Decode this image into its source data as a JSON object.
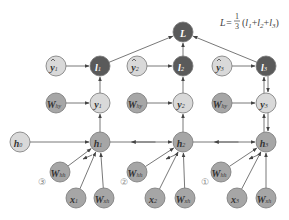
{
  "diagram": {
    "formula": {
      "lhs": "L=",
      "frac_num": "1",
      "frac_den": "3",
      "rhs_open": "(",
      "terms": [
        "l",
        "1",
        "+",
        "l",
        "2",
        "+",
        "l",
        "3"
      ],
      "rhs_close": ")"
    },
    "colors": {
      "dark_fill": "#5a5a5a",
      "dark_text": "#ffffff",
      "light_fill": "#d9d9d9",
      "mid_fill": "#a6a6a6",
      "stroke": "#777777",
      "edge": "#555555",
      "text": "#333333"
    },
    "nodes": [
      {
        "id": "L",
        "base": "L",
        "sub": "",
        "hat": false,
        "style": "dark"
      },
      {
        "id": "yhat1",
        "base": "y",
        "sub": "1",
        "hat": true,
        "style": "light"
      },
      {
        "id": "l1",
        "base": "l",
        "sub": "1",
        "hat": false,
        "style": "dark"
      },
      {
        "id": "yhat2",
        "base": "y",
        "sub": "2",
        "hat": true,
        "style": "light"
      },
      {
        "id": "l2",
        "base": "l",
        "sub": "2",
        "hat": false,
        "style": "dark"
      },
      {
        "id": "yhat3",
        "base": "y",
        "sub": "3",
        "hat": true,
        "style": "light"
      },
      {
        "id": "l3",
        "base": "l",
        "sub": "3",
        "hat": false,
        "style": "dark"
      },
      {
        "id": "Why1",
        "base": "W",
        "sub": "hy",
        "hat": false,
        "style": "mid"
      },
      {
        "id": "y1",
        "base": "y",
        "sub": "1",
        "hat": false,
        "style": "light"
      },
      {
        "id": "Why2",
        "base": "W",
        "sub": "hy",
        "hat": false,
        "style": "mid"
      },
      {
        "id": "y2",
        "base": "y",
        "sub": "2",
        "hat": false,
        "style": "light"
      },
      {
        "id": "Why3",
        "base": "W",
        "sub": "hy",
        "hat": false,
        "style": "mid"
      },
      {
        "id": "y3",
        "base": "y",
        "sub": "3",
        "hat": false,
        "style": "light"
      },
      {
        "id": "h0",
        "base": "h",
        "sub": "0",
        "hat": false,
        "style": "light"
      },
      {
        "id": "h1",
        "base": "h",
        "sub": "1",
        "hat": false,
        "style": "mid"
      },
      {
        "id": "h2",
        "base": "h",
        "sub": "2",
        "hat": false,
        "style": "mid"
      },
      {
        "id": "h3",
        "base": "h",
        "sub": "3",
        "hat": false,
        "style": "mid"
      },
      {
        "id": "Whh1",
        "base": "W",
        "sub": "hh",
        "hat": false,
        "style": "mid"
      },
      {
        "id": "x1",
        "base": "x",
        "sub": "1",
        "hat": false,
        "style": "mid"
      },
      {
        "id": "Wxh1",
        "base": "W",
        "sub": "xh",
        "hat": false,
        "style": "mid"
      },
      {
        "id": "Whh2",
        "base": "W",
        "sub": "hh",
        "hat": false,
        "style": "mid"
      },
      {
        "id": "x2",
        "base": "x",
        "sub": "2",
        "hat": false,
        "style": "mid"
      },
      {
        "id": "Wxh2",
        "base": "W",
        "sub": "xh",
        "hat": false,
        "style": "mid"
      },
      {
        "id": "Whh3",
        "base": "W",
        "sub": "hh",
        "hat": false,
        "style": "mid"
      },
      {
        "id": "x3",
        "base": "x",
        "sub": "3",
        "hat": false,
        "style": "mid"
      },
      {
        "id": "Wxh3",
        "base": "W",
        "sub": "xh",
        "hat": false,
        "style": "mid"
      }
    ],
    "edges": [
      {
        "from": "l1",
        "to": "L"
      },
      {
        "from": "l2",
        "to": "L"
      },
      {
        "from": "l3",
        "to": "L"
      },
      {
        "from": "yhat1",
        "to": "l1"
      },
      {
        "from": "y1",
        "to": "l1"
      },
      {
        "from": "yhat2",
        "to": "l2"
      },
      {
        "from": "y2",
        "to": "l2"
      },
      {
        "from": "yhat3",
        "to": "l3"
      },
      {
        "from": "y3",
        "to": "l3"
      },
      {
        "from": "Why1",
        "to": "y1"
      },
      {
        "from": "h1",
        "to": "y1"
      },
      {
        "from": "Why2",
        "to": "y2"
      },
      {
        "from": "h2",
        "to": "y2"
      },
      {
        "from": "Why3",
        "to": "y3"
      },
      {
        "from": "h3",
        "to": "y3"
      },
      {
        "from": "h0",
        "to": "h1"
      },
      {
        "from": "h1",
        "to": "h2"
      },
      {
        "from": "h2",
        "to": "h3"
      },
      {
        "from": "Whh1",
        "to": "h1"
      },
      {
        "from": "x1",
        "to": "h1"
      },
      {
        "from": "Wxh1",
        "to": "h1"
      },
      {
        "from": "Whh2",
        "to": "h2"
      },
      {
        "from": "x2",
        "to": "h2"
      },
      {
        "from": "Wxh2",
        "to": "h2"
      },
      {
        "from": "Whh3",
        "to": "h3"
      },
      {
        "from": "x3",
        "to": "h3"
      },
      {
        "from": "Wxh3",
        "to": "h3"
      }
    ],
    "backprop_edges": [
      {
        "from": "l3",
        "to": "y3"
      },
      {
        "from": "y3",
        "to": "h3"
      },
      {
        "from": "h3",
        "to": "h2"
      },
      {
        "from": "h2",
        "to": "h1"
      }
    ],
    "step_markers": [
      {
        "id": "step3",
        "label": "③"
      },
      {
        "id": "step2",
        "label": "②"
      },
      {
        "id": "step1",
        "label": "①"
      }
    ]
  }
}
